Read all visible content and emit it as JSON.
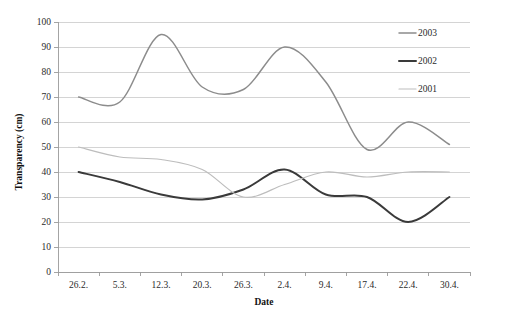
{
  "chart_data": {
    "type": "line",
    "title": "",
    "xlabel": "Date",
    "ylabel": "Transparency (cm)",
    "ylim": [
      0,
      100
    ],
    "ytick_step": 10,
    "yticks": [
      "0",
      "10",
      "20",
      "30",
      "40",
      "50",
      "60",
      "70",
      "80",
      "90",
      "100"
    ],
    "grid": true,
    "legend_position": "top-right",
    "categories": [
      "26.2.",
      "5.3.",
      "12.3.",
      "20.3.",
      "26.3.",
      "2.4.",
      "9.4.",
      "17.4.",
      "22.4.",
      "30.4."
    ],
    "series": [
      {
        "name": "2003",
        "color": "#8c8c8c",
        "width": 1.5,
        "values": [
          70,
          68,
          95,
          74,
          73,
          90,
          76,
          49,
          60,
          51
        ]
      },
      {
        "name": "2002",
        "color": "#3a3a3a",
        "width": 2.0,
        "values": [
          40,
          36,
          31,
          29,
          33,
          41,
          31,
          30,
          20,
          30
        ]
      },
      {
        "name": "2001",
        "color": "#bdbdbd",
        "width": 1.2,
        "values": [
          50,
          46,
          45,
          41,
          30,
          35,
          40,
          38,
          40,
          40
        ]
      }
    ]
  },
  "legend": {
    "items": [
      {
        "label": "2003"
      },
      {
        "label": "2002"
      },
      {
        "label": "2001"
      }
    ]
  },
  "axes": {
    "x_title": "Date",
    "y_title": "Transparency (cm)"
  }
}
